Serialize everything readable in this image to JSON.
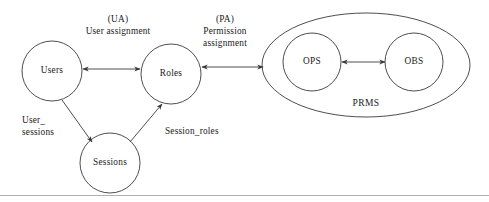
{
  "diagram": {
    "type": "rbac-reference-model",
    "nodes": [
      {
        "id": "users",
        "label": "Users",
        "cx": 52,
        "cy": 71,
        "r": 30
      },
      {
        "id": "roles",
        "label": "Roles",
        "cx": 171,
        "cy": 74,
        "r": 30
      },
      {
        "id": "sessions",
        "label": "Sessions",
        "cx": 110,
        "cy": 163,
        "r": 30
      },
      {
        "id": "ops",
        "label": "OPS",
        "cx": 312,
        "cy": 62,
        "r": 29
      },
      {
        "id": "obs",
        "label": "OBS",
        "cx": 414,
        "cy": 62,
        "r": 29
      }
    ],
    "groups": [
      {
        "id": "prms",
        "label": "PRMS",
        "cx": 366,
        "cy": 65,
        "rx": 104,
        "ry": 52,
        "label_x": 366,
        "label_y": 106
      }
    ],
    "edges": [
      {
        "id": "user-assignment",
        "from": "users",
        "to": "roles",
        "arrows": "both",
        "label_lines": [
          "(UA)",
          "User assignment"
        ],
        "label_x": 118,
        "label_y": 22
      },
      {
        "id": "permission-assignment",
        "from": "roles",
        "to": "prms",
        "arrows": "both",
        "label_lines": [
          "(PA)",
          "Permission",
          "assignment"
        ],
        "label_x": 225,
        "label_y": 22
      },
      {
        "id": "user-sessions",
        "from": "users",
        "to": "sessions",
        "arrows": "end",
        "label_lines": [
          "User_",
          "sessions"
        ],
        "label_x": 22,
        "label_y": 123
      },
      {
        "id": "session-roles",
        "from": "sessions",
        "to": "roles",
        "arrows": "end",
        "label_lines": [
          "Session_roles"
        ],
        "label_x": 165,
        "label_y": 134
      },
      {
        "id": "ops-obs",
        "from": "ops",
        "to": "obs",
        "arrows": "both",
        "label_lines": [],
        "label_x": 363,
        "label_y": 52
      }
    ],
    "colors": {
      "stroke": "#3a3a3a",
      "text": "#1a1a1a",
      "background": "#ffffff",
      "rule": "#9a9aa2"
    }
  }
}
